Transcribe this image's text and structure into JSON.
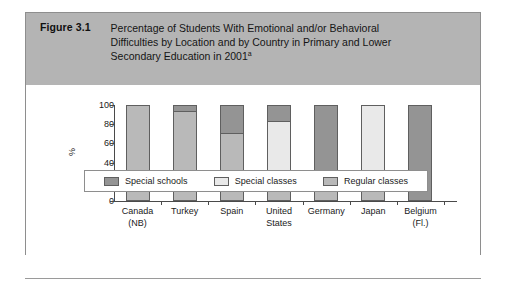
{
  "figure": {
    "number": "Figure 3.1",
    "title_line1": "Percentage of Students With Emotional and/or Behavioral",
    "title_line2": "Difficulties by Location and by Country in Primary and Lower",
    "title_line3": "Secondary Education in 2001",
    "title_superscript": "a",
    "header_bg": "#b4b4b4",
    "border_color": "#8e8e8e"
  },
  "chart_data": {
    "type": "bar",
    "subtype": "stacked-vertical-100",
    "title": "Percentage of Students With Emotional and/or Behavioral Difficulties by Location and by Country in Primary and Lower Secondary Education in 2001",
    "xlabel": "",
    "ylabel": "%",
    "ylim": [
      0,
      100
    ],
    "yticks": [
      0,
      20,
      40,
      60,
      80,
      100
    ],
    "grid": false,
    "legend_position": "bottom",
    "categories": [
      "Canada\n(NB)",
      "Turkey",
      "Spain",
      "United\nStates",
      "Germany",
      "Japan",
      "Belgium\n(Fl.)"
    ],
    "category_labels": [
      {
        "line1": "Canada",
        "line2": "(NB)"
      },
      {
        "line1": "Turkey",
        "line2": ""
      },
      {
        "line1": "Spain",
        "line2": ""
      },
      {
        "line1": "United",
        "line2": "States"
      },
      {
        "line1": "Germany",
        "line2": ""
      },
      {
        "line1": "Japan",
        "line2": ""
      },
      {
        "line1": "Belgium",
        "line2": "(Fl.)"
      }
    ],
    "series": [
      {
        "name": "Regular classes",
        "color": "#b9b9b9",
        "values": [
          100,
          94,
          70,
          27,
          27,
          14,
          0
        ]
      },
      {
        "name": "Special classes",
        "color": "#e9e9e9",
        "values": [
          0,
          0,
          0,
          56,
          0,
          86,
          0
        ]
      },
      {
        "name": "Special schools",
        "color": "#949494",
        "values": [
          0,
          6,
          30,
          17,
          73,
          0,
          100
        ]
      }
    ],
    "stack_order_bottom_to_top": [
      "Regular classes",
      "Special classes",
      "Special schools"
    ]
  },
  "legend": {
    "items": [
      {
        "label": "Special schools",
        "color": "#949494"
      },
      {
        "label": "Special classes",
        "color": "#e9e9e9"
      },
      {
        "label": "Regular classes",
        "color": "#b9b9b9"
      }
    ]
  }
}
